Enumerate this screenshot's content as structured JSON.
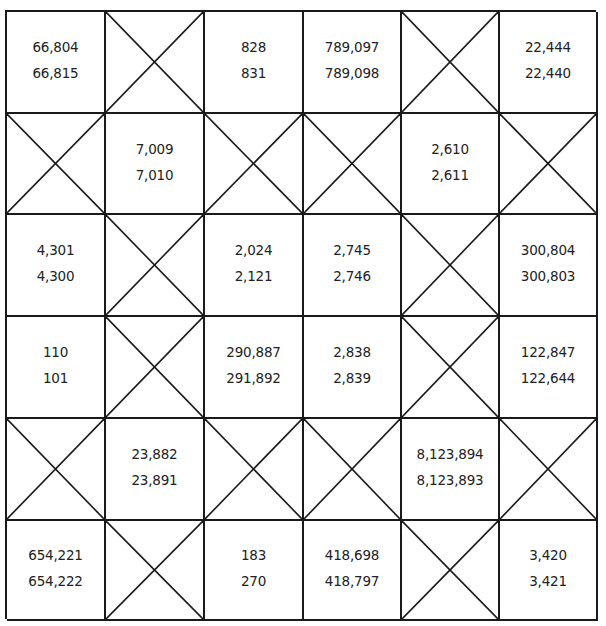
{
  "grid": {
    "rows": 6,
    "cols": 6,
    "cells": [
      [
        {
          "type": "pair",
          "top": "66,804",
          "bottom": "66,815"
        },
        {
          "type": "crossed"
        },
        {
          "type": "pair",
          "top": "828",
          "bottom": "831"
        },
        {
          "type": "pair",
          "top": "789,097",
          "bottom": "789,098"
        },
        {
          "type": "crossed"
        },
        {
          "type": "pair",
          "top": "22,444",
          "bottom": "22,440"
        }
      ],
      [
        {
          "type": "crossed"
        },
        {
          "type": "pair",
          "top": "7,009",
          "bottom": "7,010"
        },
        {
          "type": "crossed"
        },
        {
          "type": "crossed"
        },
        {
          "type": "pair",
          "top": "2,610",
          "bottom": "2,611"
        },
        {
          "type": "crossed"
        }
      ],
      [
        {
          "type": "pair",
          "top": "4,301",
          "bottom": "4,300"
        },
        {
          "type": "crossed"
        },
        {
          "type": "pair",
          "top": "2,024",
          "bottom": "2,121"
        },
        {
          "type": "pair",
          "top": "2,745",
          "bottom": "2,746"
        },
        {
          "type": "crossed"
        },
        {
          "type": "pair",
          "top": "300,804",
          "bottom": "300,803"
        }
      ],
      [
        {
          "type": "pair",
          "top": "110",
          "bottom": "101"
        },
        {
          "type": "crossed"
        },
        {
          "type": "pair",
          "top": "290,887",
          "bottom": "291,892"
        },
        {
          "type": "pair",
          "top": "2,838",
          "bottom": "2,839"
        },
        {
          "type": "crossed"
        },
        {
          "type": "pair",
          "top": "122,847",
          "bottom": "122,644"
        }
      ],
      [
        {
          "type": "crossed"
        },
        {
          "type": "pair",
          "top": "23,882",
          "bottom": "23,891"
        },
        {
          "type": "crossed"
        },
        {
          "type": "crossed"
        },
        {
          "type": "pair",
          "top": "8,123,894",
          "bottom": "8,123,893"
        },
        {
          "type": "crossed"
        }
      ],
      [
        {
          "type": "pair",
          "top": "654,221",
          "bottom": "654,222"
        },
        {
          "type": "crossed"
        },
        {
          "type": "pair",
          "top": "183",
          "bottom": "270"
        },
        {
          "type": "pair",
          "top": "418,698",
          "bottom": "418,797"
        },
        {
          "type": "crossed"
        },
        {
          "type": "pair",
          "top": "3,420",
          "bottom": "3,421"
        }
      ]
    ]
  },
  "colors": {
    "line": "#1a1a1a",
    "text": "#222222",
    "background": "#ffffff"
  }
}
